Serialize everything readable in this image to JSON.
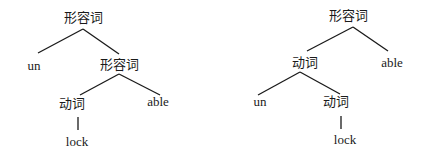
{
  "trees": [
    {
      "name": "left-tree",
      "nodes": {
        "root": "形容词",
        "prefix": "un",
        "inner_adj": "形容词",
        "verb": "动词",
        "suffix": "able",
        "leaf": "lock"
      }
    },
    {
      "name": "right-tree",
      "nodes": {
        "root": "形容词",
        "verb_outer": "动词",
        "suffix": "able",
        "prefix": "un",
        "verb_inner": "动词",
        "leaf": "lock"
      }
    }
  ],
  "colors": {
    "line": "#1a1a1a",
    "background": "#ffffff"
  }
}
